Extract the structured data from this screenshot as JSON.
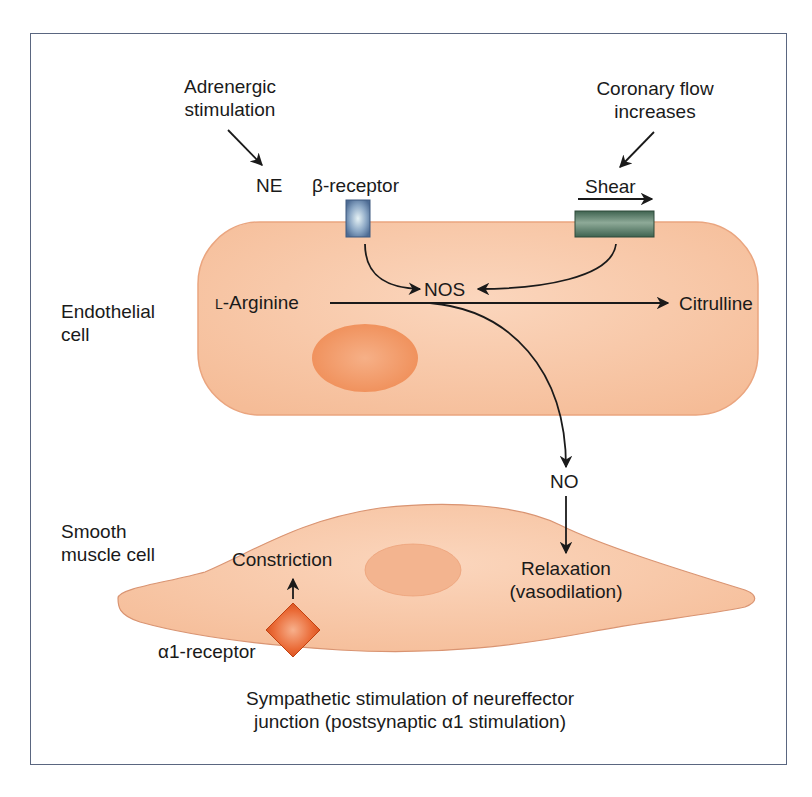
{
  "figure": {
    "caption_line1": "Sympathetic stimulation of neureffector",
    "caption_line2": "junction (postsynaptic α1 stimulation)"
  },
  "labels": {
    "adrenergic_line1": "Adrenergic",
    "adrenergic_line2": "stimulation",
    "coronary_line1": "Coronary flow",
    "coronary_line2": "increases",
    "ne": "NE",
    "beta_receptor": "β-receptor",
    "shear": "Shear",
    "endothelial_line1": "Endothelial",
    "endothelial_line2": "cell",
    "l_prefix": "L",
    "arginine": "-Arginine",
    "nos": "NOS",
    "citrulline": "Citrulline",
    "no": "NO",
    "smooth_line1": "Smooth",
    "smooth_line2": "muscle cell",
    "constriction": "Constriction",
    "relaxation_line1": "Relaxation",
    "relaxation_line2": "(vasodilation)",
    "alpha_receptor": "α1-receptor"
  },
  "colors": {
    "frame": "#5a6680",
    "cell_fill": "#f7c4a2",
    "cell_edge": "#e9a37c",
    "nucleus_endo": "#f29a66",
    "nucleus_smooth": "#f3b48f",
    "beta_receptor": "#5d7ea6",
    "shear_receptor": "#4f7560",
    "alpha_receptor": "#e0531f"
  }
}
